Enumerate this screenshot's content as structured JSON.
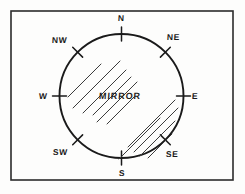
{
  "figure": {
    "frame": {
      "x": 11,
      "y": 11,
      "width": 222,
      "height": 169,
      "stroke": "#2b2b2b",
      "stroke_width": 1.6,
      "fill": "#fdfdfc"
    },
    "circle": {
      "label": "MIRROR",
      "cx": 121.5,
      "cy": 96,
      "r": 62,
      "stroke": "#1a1a1a",
      "stroke_width": 1.9,
      "fill": "none"
    },
    "center_label": {
      "text": "MIRROR",
      "x": 99,
      "y": 92
    },
    "compass_points": [
      {
        "name": "north",
        "abbr": "N",
        "angle_deg": 0,
        "label_x": 118,
        "label_y": 14,
        "tick": true
      },
      {
        "name": "northeast",
        "abbr": "NE",
        "angle_deg": 45,
        "label_x": 167,
        "label_y": 33,
        "tick": true
      },
      {
        "name": "east",
        "abbr": "E",
        "angle_deg": 90,
        "label_x": 192,
        "label_y": 92,
        "tick": true
      },
      {
        "name": "southeast",
        "abbr": "SE",
        "angle_deg": 135,
        "label_x": 166,
        "label_y": 150,
        "tick": true
      },
      {
        "name": "south",
        "abbr": "S",
        "angle_deg": 180,
        "label_x": 119,
        "label_y": 169,
        "tick": true
      },
      {
        "name": "southwest",
        "abbr": "SW",
        "angle_deg": 225,
        "label_x": 53,
        "label_y": 148,
        "tick": true
      },
      {
        "name": "west",
        "abbr": "W",
        "angle_deg": 270,
        "label_x": 39,
        "label_y": 92,
        "tick": true
      },
      {
        "name": "northwest",
        "abbr": "NW",
        "angle_deg": 315,
        "label_x": 52,
        "label_y": 36,
        "tick": true
      }
    ],
    "tick_marks": {
      "inner_offset": -7,
      "outer_offset": 7,
      "stroke": "#1a1a1a",
      "stroke_width": 1.5
    },
    "hatching": {
      "description": "two groups of parallel 45-degree shading strokes indicating the reflective mirror surface",
      "stroke": "#3a3a3a",
      "stroke_width": 1.0,
      "angle_deg": 45,
      "groups": [
        {
          "name": "upper-left-hatch",
          "lines": [
            {
              "x1": 68,
              "y1": 97,
              "x2": 101,
              "y2": 64
            },
            {
              "x1": 73,
              "y1": 108,
              "x2": 120,
              "y2": 61
            },
            {
              "x1": 83,
              "y1": 113,
              "x2": 126,
              "y2": 70
            },
            {
              "x1": 93,
              "y1": 115,
              "x2": 131,
              "y2": 77
            },
            {
              "x1": 97,
              "y1": 122,
              "x2": 137,
              "y2": 82
            },
            {
              "x1": 107,
              "y1": 124,
              "x2": 134,
              "y2": 97
            }
          ]
        },
        {
          "name": "lower-right-hatch",
          "lines": [
            {
              "x1": 128,
              "y1": 147,
              "x2": 175,
              "y2": 100
            },
            {
              "x1": 134,
              "y1": 152,
              "x2": 178,
              "y2": 108
            },
            {
              "x1": 140,
              "y1": 156,
              "x2": 175,
              "y2": 121
            },
            {
              "x1": 148,
              "y1": 158,
              "x2": 172,
              "y2": 134
            },
            {
              "x1": 119,
              "y1": 159,
              "x2": 160,
              "y2": 118
            }
          ]
        }
      ]
    }
  }
}
